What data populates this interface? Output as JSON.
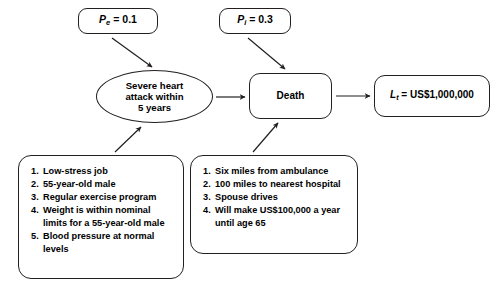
{
  "diagram": {
    "type": "influence-diagram",
    "nodes": {
      "prob_event": {
        "symbol": "P",
        "subscript": "e",
        "operator": "=",
        "value": "0.1",
        "full_text": "Pe = 0.1"
      },
      "prob_impact": {
        "symbol": "P",
        "subscript": "i",
        "operator": "=",
        "value": "0.3",
        "full_text": "Pi = 0.3"
      },
      "heart_attack": {
        "label": "Severe heart\nattack within\n5 years"
      },
      "death": {
        "label": "Death"
      },
      "loss": {
        "symbol": "L",
        "subscript": "t",
        "operator": "=",
        "value": "US$1,000,000",
        "full_text": "Lt = US$1,000,000"
      }
    },
    "left_conditions": {
      "items": [
        "Low-stress job",
        "55-year-old male",
        "Regular exercise program",
        "Weight is within nominal\nlimits for a 55-year-old male",
        "Blood pressure at normal\nlevels"
      ]
    },
    "right_conditions": {
      "items": [
        "Six miles from ambulance",
        "100 miles to nearest hospital",
        "Spouse drives",
        "Will make US$100,000 a year\nuntil age 65"
      ]
    },
    "colors": {
      "stroke": "#231f20",
      "background": "#ffffff",
      "text": "#000000"
    }
  }
}
